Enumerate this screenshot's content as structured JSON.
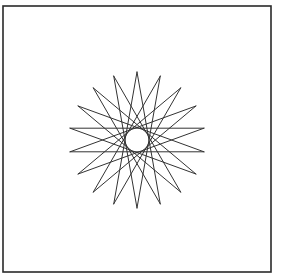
{
  "figure": {
    "frame": {
      "x": 3,
      "y": 6,
      "width": 268,
      "height": 266,
      "stroke": "#2a2a2a",
      "stroke_width": 1.6
    },
    "star": {
      "type": "star-polygon",
      "points": 18,
      "step": 8,
      "center": [
        137,
        140
      ],
      "outer_radius": 68,
      "start_angle_deg": -90,
      "stroke": "#333333",
      "stroke_width": 1
    },
    "background": "#ffffff"
  }
}
